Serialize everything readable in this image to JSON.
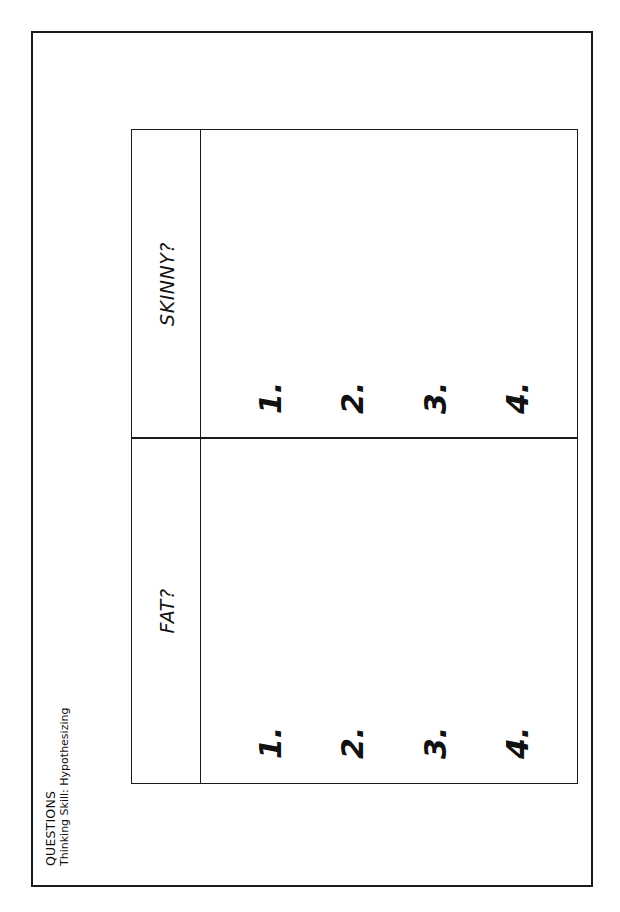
{
  "worksheet": {
    "title": "QUESTIONS",
    "subtitle": "Thinking Skill: Hypothesizing",
    "orientation": "rotated 90° counter-clockwise"
  },
  "table": {
    "columns": [
      {
        "header": "FAT?",
        "items": [
          "1.",
          "2.",
          "3.",
          "4."
        ]
      },
      {
        "header": "SKINNY?",
        "items": [
          "1.",
          "2.",
          "3.",
          "4."
        ]
      }
    ]
  },
  "colors": {
    "ink": "#111111",
    "background": "#ffffff"
  }
}
